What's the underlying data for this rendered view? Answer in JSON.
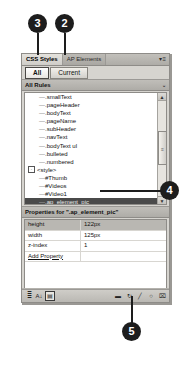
{
  "callouts": [
    {
      "id": "callout-3",
      "label": "3"
    },
    {
      "id": "callout-2",
      "label": "2"
    },
    {
      "id": "callout-4",
      "label": "4"
    },
    {
      "id": "callout-5",
      "label": "5"
    }
  ],
  "panel": {
    "tabs": [
      {
        "label": "CSS Styles",
        "active": true
      },
      {
        "label": "AP Elements",
        "active": false
      }
    ],
    "menu_glyph": "▾≡",
    "filter": {
      "all_label": "All",
      "current_label": "Current",
      "selected": "All"
    },
    "rules_section": {
      "title": "All Rules",
      "header_glyph": "⌄"
    },
    "rules": [
      {
        "label": ".smallText",
        "level": 2,
        "selected": false,
        "expander": ""
      },
      {
        "label": ".pageHeader",
        "level": 2,
        "selected": false,
        "expander": ""
      },
      {
        "label": ".bodyText",
        "level": 2,
        "selected": false,
        "expander": ""
      },
      {
        "label": ".pageName",
        "level": 2,
        "selected": false,
        "expander": ""
      },
      {
        "label": ".subHeader",
        "level": 2,
        "selected": false,
        "expander": ""
      },
      {
        "label": ".navText",
        "level": 2,
        "selected": false,
        "expander": ""
      },
      {
        "label": ".bodyText ul",
        "level": 2,
        "selected": false,
        "expander": ""
      },
      {
        "label": ".bulleted",
        "level": 2,
        "selected": false,
        "expander": ""
      },
      {
        "label": ".numbered",
        "level": 2,
        "selected": false,
        "expander": ""
      },
      {
        "label": "<style>",
        "level": 1,
        "selected": false,
        "expander": "-"
      },
      {
        "label": "#Thumb",
        "level": 2,
        "selected": false,
        "expander": ""
      },
      {
        "label": "#Videos",
        "level": 2,
        "selected": false,
        "expander": ""
      },
      {
        "label": "#Video1",
        "level": 2,
        "selected": false,
        "expander": ""
      },
      {
        "label": ".ap_element_pic",
        "level": 2,
        "selected": true,
        "expander": ""
      }
    ],
    "scrollbar": {
      "up_glyph": "▲",
      "down_glyph": "▼",
      "grip_glyph": "≡"
    },
    "properties": {
      "header": "Properties for \".ap_element_pic\"",
      "rows": [
        {
          "name": "height",
          "value": "122px",
          "highlight": true,
          "link": false
        },
        {
          "name": "width",
          "value": "125px",
          "highlight": false,
          "link": false
        },
        {
          "name": "z-index",
          "value": "1",
          "highlight": false,
          "link": false
        },
        {
          "name": "Add Property",
          "value": "",
          "highlight": false,
          "link": true
        }
      ]
    },
    "toolbar": {
      "left_icons": [
        {
          "name": "show-category-view-icon",
          "glyph": "≣"
        },
        {
          "name": "show-list-view-icon",
          "glyph": "A↓"
        },
        {
          "name": "show-only-set-properties-icon",
          "glyph": "▤"
        }
      ],
      "right_icons": [
        {
          "name": "attach-style-sheet-icon",
          "glyph": "▬"
        },
        {
          "name": "new-css-rule-icon",
          "glyph": "↻"
        },
        {
          "name": "edit-rule-icon",
          "glyph": "╱"
        },
        {
          "name": "disable-css-property-icon",
          "glyph": "○"
        },
        {
          "name": "delete-css-rule-icon",
          "glyph": "⌧"
        }
      ]
    }
  }
}
